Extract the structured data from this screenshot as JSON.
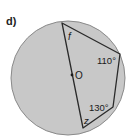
{
  "part_label": "d)",
  "diagram": {
    "type": "cyclic-quadrilateral",
    "circle": {
      "cx": 68,
      "cy": 78,
      "r": 57,
      "fill": "#c8c8c8",
      "stroke": "#888888"
    },
    "center_label": "O",
    "vertices": {
      "top": [
        62,
        23
      ],
      "right": [
        120,
        54
      ],
      "lower_right": [
        113,
        107
      ],
      "bottom": [
        83,
        128
      ]
    },
    "angles": [
      {
        "label": "f",
        "vertex": "top"
      },
      {
        "label": "110°",
        "vertex": "right"
      },
      {
        "label": "130°",
        "vertex": "lower_right"
      },
      {
        "label": "z",
        "vertex": "bottom"
      }
    ]
  }
}
